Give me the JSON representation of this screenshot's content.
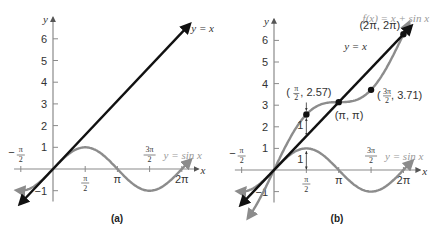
{
  "chart_data": [
    {
      "type": "line",
      "panel": "a",
      "caption": "(a)",
      "xlabel": "x",
      "ylabel": "y",
      "x_ticks": [
        "-π/2",
        "π/2",
        "π",
        "3π/2",
        "2π"
      ],
      "y_ticks": [
        "-1",
        "1",
        "2",
        "3",
        "4",
        "5",
        "6"
      ],
      "xlim": [
        -1.9,
        7.0
      ],
      "ylim": [
        -1.5,
        6.9
      ],
      "series": [
        {
          "name": "y = x",
          "color": "#111111",
          "fn": "x"
        },
        {
          "name": "y = sin x",
          "color": "#8c8c8c",
          "fn": "sin(x)"
        }
      ]
    },
    {
      "type": "line",
      "panel": "b",
      "caption": "(b)",
      "xlabel": "x",
      "ylabel": "y",
      "x_ticks": [
        "-π/2",
        "π/2",
        "π",
        "3π/2",
        "2π"
      ],
      "y_ticks": [
        "-1",
        "1",
        "2",
        "3",
        "4",
        "5",
        "6"
      ],
      "xlim": [
        -1.9,
        7.0
      ],
      "ylim": [
        -1.5,
        6.9
      ],
      "series": [
        {
          "name": "y = x",
          "color": "#111111",
          "fn": "x"
        },
        {
          "name": "y = sin x",
          "color": "#8c8c8c",
          "fn": "sin(x)"
        },
        {
          "name": "f(x) = x + sin x",
          "color": "#8c8c8c",
          "fn": "x + sin(x)"
        }
      ],
      "points": [
        {
          "label": "(π/2, 2.57)",
          "x": 1.5708,
          "y": 2.57
        },
        {
          "label": "(π, π)",
          "x": 3.1416,
          "y": 3.1416
        },
        {
          "label": "(3π/2, 3.71)",
          "x": 4.7124,
          "y": 3.71
        },
        {
          "label": "(2π, 2π)",
          "x": 6.2832,
          "y": 6.2832
        }
      ],
      "annotations": [
        {
          "text": "1",
          "note": "vertical distance from y = x to f(x) at x = π/2"
        },
        {
          "text": "1",
          "note": "vertical distance from x-axis to sin x at x = π/2"
        }
      ]
    }
  ],
  "labels": {
    "a": {
      "caption": "(a)",
      "x": "x",
      "y": "y",
      "line": "y = x",
      "sin": "y = sin x",
      "yt": [
        "6",
        "5",
        "4",
        "3",
        "2",
        "1",
        "−1"
      ],
      "pi": "π",
      "twopi": "2π",
      "pi_num": "π",
      "three_pi_num": "3π",
      "den": "2",
      "minus": "−"
    },
    "b": {
      "caption": "(b)",
      "x": "x",
      "y": "y",
      "line": "y = x",
      "sin": "y = sin x",
      "f": "f(x) = x + sin x",
      "yt": [
        "6",
        "5",
        "4",
        "3",
        "2",
        "1",
        "−1"
      ],
      "pi": "π",
      "twopi": "2π",
      "pi_num": "π",
      "three_pi_num": "3π",
      "den": "2",
      "minus": "−",
      "p1_val": ", 2.57)",
      "p1_open": "(",
      "p2": "(π, π)",
      "p3_val": ", 3.71)",
      "p3_open": "(",
      "p4": "(2π, 2π)",
      "one": "1"
    }
  }
}
